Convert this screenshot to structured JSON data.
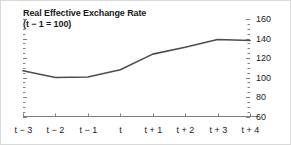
{
  "chart_data": {
    "type": "line",
    "title": "Real Effective Exchange Rate",
    "subtitle": "(t − 1 = 100)",
    "xlabel": "",
    "ylabel": "",
    "categories": [
      "t − 3",
      "t − 2",
      "t − 1",
      "t",
      "t + 1",
      "t + 2",
      "t + 3",
      "t + 4"
    ],
    "values": [
      107,
      100,
      100.5,
      108,
      124,
      131,
      139,
      138
    ],
    "series": [
      {
        "name": "Real Effective Exchange Rate",
        "values": [
          107,
          100,
          100.5,
          108,
          124,
          131,
          139,
          138
        ]
      }
    ],
    "ylim": [
      60,
      160
    ],
    "ytick_labels": [
      "160",
      "140",
      "120",
      "100",
      "80",
      "60"
    ],
    "ytick_values": [
      160,
      140,
      120,
      100,
      80,
      60
    ],
    "yminor_step": 5,
    "grid": false,
    "legend": false,
    "legend_position": "none",
    "y_axis_side": "right",
    "line_color": "#4d4d4d",
    "axis_color": "#808080",
    "text_color": "#1a1a1a"
  },
  "figure": {
    "background": "#ffffff",
    "border_color": "#d9d9d9"
  }
}
